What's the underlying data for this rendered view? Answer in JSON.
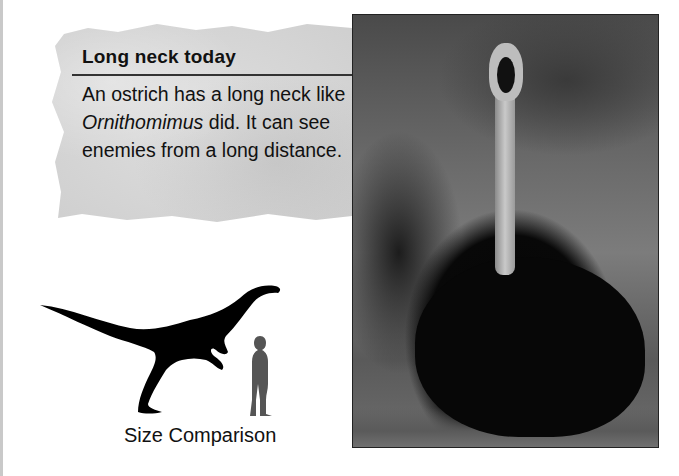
{
  "sidebar_box": {
    "title": "Long neck today",
    "body_parts": [
      {
        "text": "An ostrich has a long neck like ",
        "italic": false
      },
      {
        "text": "Ornithomimus",
        "italic": true
      },
      {
        "text": " did. It can see enemies from a long distance.",
        "italic": false
      }
    ]
  },
  "photo": {
    "subject": "ostrich-photo",
    "description": "Ostrich with long neck and open beak, sitting in grass"
  },
  "size_comparison": {
    "caption": "Size Comparison",
    "dinosaur_icon": "ornithomimus-silhouette",
    "human_icon": "human-silhouette",
    "dinosaur_color": "#000000",
    "human_color": "#555555"
  }
}
